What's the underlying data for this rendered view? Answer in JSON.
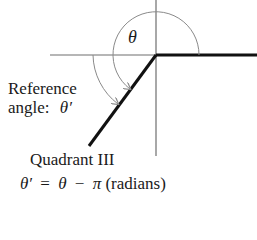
{
  "diagram": {
    "type": "reference-angle",
    "quadrant": "Quadrant III",
    "labels": {
      "theta": "θ",
      "reference_line1": "Reference",
      "reference_line2_prefix": "angle:",
      "reference_symbol": "θ′",
      "quadrant": "Quadrant III",
      "formula_lhs": "θ′",
      "formula_eq": "=",
      "formula_theta": "θ",
      "formula_minus": "−",
      "formula_pi": "π",
      "formula_unit": "(radians)"
    },
    "colors": {
      "axis": "#6e6e6e",
      "terminal": "#111111",
      "arc": "#8a8a8a",
      "text": "#1a1a1a"
    }
  }
}
